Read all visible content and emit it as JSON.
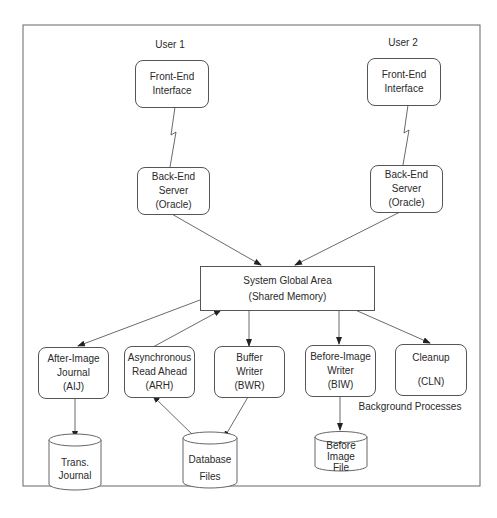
{
  "diagram": {
    "users": [
      {
        "label": "User 1",
        "front_end": [
          "Front-End",
          "Interface"
        ],
        "back_end": [
          "Back-End",
          "Server",
          "(Oracle)"
        ]
      },
      {
        "label": "User 2",
        "front_end": [
          "Front-End",
          "Interface"
        ],
        "back_end": [
          "Back-End",
          "Server",
          "(Oracle)"
        ]
      }
    ],
    "sga": [
      "System Global Area",
      "(Shared Memory)"
    ],
    "processes": [
      {
        "id": "aij",
        "lines": [
          "After-Image",
          "Journal",
          "(AIJ)"
        ]
      },
      {
        "id": "arh",
        "lines": [
          "Asynchronous",
          "Read Ahead",
          "(ARH)"
        ]
      },
      {
        "id": "bwr",
        "lines": [
          "Buffer",
          "Writer",
          "(BWR)"
        ]
      },
      {
        "id": "biw",
        "lines": [
          "Before-Image",
          "Writer",
          "(BIW)"
        ]
      },
      {
        "id": "cln",
        "lines": [
          "Cleanup",
          "(CLN)"
        ]
      }
    ],
    "background_label": "Background Processes",
    "storage": [
      {
        "id": "trans-journal",
        "lines": [
          "Trans.",
          "Journal"
        ]
      },
      {
        "id": "database-files",
        "lines": [
          "Database",
          "Files"
        ]
      },
      {
        "id": "before-image-file",
        "lines": [
          "Before",
          "Image",
          "File"
        ]
      }
    ],
    "connections": [
      {
        "from": "front-end-1",
        "to": "back-end-1",
        "style": "lightning"
      },
      {
        "from": "front-end-2",
        "to": "back-end-2",
        "style": "lightning"
      },
      {
        "from": "back-end-1",
        "to": "sga",
        "style": "arrow"
      },
      {
        "from": "back-end-2",
        "to": "sga",
        "style": "arrow"
      },
      {
        "from": "sga",
        "to": "aij",
        "style": "arrow"
      },
      {
        "from": "arh",
        "to": "sga",
        "style": "arrow"
      },
      {
        "from": "sga",
        "to": "bwr",
        "style": "arrow"
      },
      {
        "from": "sga",
        "to": "biw",
        "style": "arrow"
      },
      {
        "from": "sga",
        "to": "cln",
        "style": "arrow"
      },
      {
        "from": "aij",
        "to": "trans-journal",
        "style": "arrow"
      },
      {
        "from": "database-files",
        "to": "arh",
        "style": "arrow"
      },
      {
        "from": "bwr",
        "to": "database-files",
        "style": "arrow"
      },
      {
        "from": "biw",
        "to": "before-image-file",
        "style": "arrow"
      }
    ]
  }
}
